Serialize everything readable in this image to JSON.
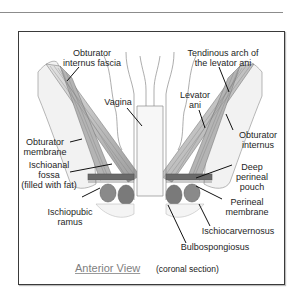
{
  "figure": {
    "caption_title": "Anterior View",
    "caption_subtitle": "(coronal section)",
    "colors": {
      "muscle_fill": "#c8c8c8",
      "muscle_stroke": "#6e6e6e",
      "outline": "#8a8a8a",
      "label_text": "#1e1e1e",
      "caption_title": "#808080",
      "frame_border": "#3a3a3a"
    }
  },
  "labels": [
    {
      "id": "obturator-internus-fascia",
      "text": "Obturator\ninternus fascia",
      "x": 62,
      "y": 48,
      "w": 60,
      "line": [
        79,
        67,
        67,
        81
      ]
    },
    {
      "id": "tendinous-arch",
      "text": "Tendinous arch of\nthe levator ani",
      "x": 183,
      "y": 48,
      "w": 80,
      "line": [
        219,
        67,
        229,
        92
      ]
    },
    {
      "id": "vagina",
      "text": "Vagina",
      "x": 99,
      "y": 97,
      "w": 38,
      "line": [
        127,
        108,
        142,
        126
      ]
    },
    {
      "id": "levator-ani",
      "text": "Levator\nani",
      "x": 174,
      "y": 90,
      "w": 42,
      "line": [
        199,
        110,
        205,
        128
      ]
    },
    {
      "id": "obturator-membrane",
      "text": "Obturator\nmembrane",
      "x": 20,
      "y": 137,
      "w": 50,
      "line": [
        70,
        142,
        82,
        139
      ]
    },
    {
      "id": "obturator-internus",
      "text": "Obturator\ninternus",
      "x": 232,
      "y": 130,
      "w": 52,
      "line": [
        233,
        130,
        226,
        114
      ]
    },
    {
      "id": "ischioanal-fossa",
      "text": "Ischioanal\nfossa\n(filled with fat)",
      "x": 14,
      "y": 160,
      "w": 70,
      "line": [
        70,
        172,
        112,
        164
      ]
    },
    {
      "id": "deep-perineal-pouch",
      "text": "Deep\nperineal\npouch",
      "x": 230,
      "y": 162,
      "w": 44,
      "line": [
        232,
        165,
        196,
        178
      ]
    },
    {
      "id": "ischiopubic-ramus",
      "text": "Ischiopubic\nramus",
      "x": 45,
      "y": 207,
      "w": 50,
      "line": [
        82,
        197,
        100,
        188
      ]
    },
    {
      "id": "perineal-membrane",
      "text": "Perineal\nmembrane",
      "x": 218,
      "y": 197,
      "w": 58,
      "line": [
        222,
        199,
        196,
        186
      ]
    },
    {
      "id": "ischiocarvernosus",
      "text": "Ischiocarvernosus",
      "x": 196,
      "y": 226,
      "w": 84,
      "line": [
        210,
        226,
        199,
        204
      ]
    },
    {
      "id": "bulbospongiosus",
      "text": "Bulbospongiosus",
      "x": 176,
      "y": 242,
      "w": 78,
      "line": [
        186,
        243,
        168,
        205
      ]
    }
  ]
}
